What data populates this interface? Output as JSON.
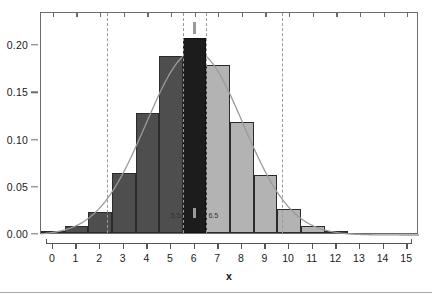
{
  "chart_data": {
    "type": "bar",
    "title": "",
    "subtitle": "",
    "xlabel": "x",
    "ylabel": "",
    "grid": false,
    "legend": null,
    "xlim": [
      -0.5,
      15.5
    ],
    "ylim": [
      0.0,
      0.235
    ],
    "categories": [
      "0",
      "1",
      "2",
      "3",
      "4",
      "5",
      "6",
      "7",
      "8",
      "9",
      "10",
      "11",
      "12",
      "13",
      "14",
      "15"
    ],
    "x": [
      0,
      1,
      2,
      3,
      4,
      5,
      6,
      7,
      8,
      9,
      10,
      11,
      12,
      13,
      14,
      15
    ],
    "values": [
      0.0005,
      0.0075,
      0.0225,
      0.0635,
      0.127,
      0.187,
      0.2065,
      0.178,
      0.1175,
      0.0615,
      0.0255,
      0.0075,
      0.0015,
      0.0,
      0.0,
      0.0
    ],
    "bar_width": 1,
    "bar_colors": [
      "#4e4e4e",
      "#4e4e4e",
      "#4e4e4e",
      "#4e4e4e",
      "#4e4e4e",
      "#4e4e4e",
      "#1c1c1c",
      "#b3b3b3",
      "#b3b3b3",
      "#b3b3b3",
      "#b3b3b3",
      "#b3b3b3",
      "#b3b3b3",
      "#b3b3b3",
      "#b3b3b3",
      "#b3b3b3"
    ],
    "highlight_bin": {
      "from": 5.5,
      "to": 6.5,
      "color": "#1c1c1c",
      "label_left": "5.5",
      "label_right": "6.5"
    },
    "overlay_curve": {
      "type": "line",
      "name": "normal density",
      "color": "#9a9a9a",
      "mean": 6.0,
      "sd": 2.05,
      "peak": 0.1945
    },
    "vertical_reference_lines": [
      {
        "x": 2.3,
        "style": "dashed",
        "color": "#9a9a9a"
      },
      {
        "x": 5.5,
        "style": "dashed",
        "color": "#9a9a9a"
      },
      {
        "x": 6.5,
        "style": "dashed",
        "color": "#9a9a9a"
      },
      {
        "x": 9.7,
        "style": "dashed",
        "color": "#9a9a9a"
      }
    ],
    "point_markers": [
      {
        "x": 6.0,
        "position": "above-peak",
        "color": "#9a9a9a"
      },
      {
        "x": 6.0,
        "position": "below-axis",
        "color": "#9a9a9a"
      }
    ],
    "yticks": [
      {
        "value": 0.0,
        "label": "0.00"
      },
      {
        "value": 0.05,
        "label": "0.05"
      },
      {
        "value": 0.1,
        "label": "0.10"
      },
      {
        "value": 0.15,
        "label": "0.15"
      },
      {
        "value": 0.2,
        "label": "0.20"
      }
    ],
    "xticks": [
      {
        "value": 0,
        "label": "0"
      },
      {
        "value": 1,
        "label": "1"
      },
      {
        "value": 2,
        "label": "2"
      },
      {
        "value": 3,
        "label": "3"
      },
      {
        "value": 4,
        "label": "4"
      },
      {
        "value": 5,
        "label": "5"
      },
      {
        "value": 6,
        "label": "6"
      },
      {
        "value": 7,
        "label": "7"
      },
      {
        "value": 8,
        "label": "8"
      },
      {
        "value": 9,
        "label": "9"
      },
      {
        "value": 10,
        "label": "10"
      },
      {
        "value": 11,
        "label": "11"
      },
      {
        "value": 12,
        "label": "12"
      },
      {
        "value": 13,
        "label": "13"
      },
      {
        "value": 14,
        "label": "14"
      },
      {
        "value": 15,
        "label": "15"
      }
    ],
    "annotations": [
      {
        "text": "5.5",
        "x": 5.5,
        "placement": "below-axis-inside"
      },
      {
        "text": "6.5",
        "x": 6.5,
        "placement": "below-axis-inside"
      }
    ],
    "colors": {
      "bar_left": "#4e4e4e",
      "bar_right": "#b3b3b3",
      "bar_highlight": "#1c1c1c",
      "bar_border": "#2b2b2b",
      "curve": "#9a9a9a",
      "dashed_line": "#9a9a9a",
      "axis": "#6b6b6b",
      "text": "#1a1a1a",
      "background": "#ffffff",
      "footer_rule": "#a9a9a9"
    }
  }
}
